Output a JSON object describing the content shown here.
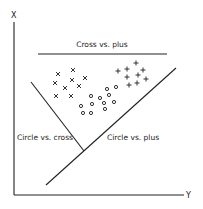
{
  "diagram": {
    "axes": {
      "vertical_label": "X",
      "horizontal_label": "Y"
    },
    "boundaries": [
      {
        "label": "Cross vs. plus",
        "x1": 38,
        "y1": 54,
        "x2": 167,
        "y2": 54
      },
      {
        "label": "Circle vs. cross",
        "x1": 31,
        "y1": 82,
        "x2": 84,
        "y2": 151
      },
      {
        "label": "Circle vs. plus",
        "x1": 46,
        "y1": 185,
        "x2": 176,
        "y2": 68
      }
    ],
    "labels": {
      "cross_vs_plus": "Cross vs. plus",
      "circle_vs_cross": "Circle vs. cross",
      "circle_vs_plus": "Circle vs. plus"
    },
    "classes": {
      "cross": {
        "symbol": "×",
        "points": [
          [
            58,
            74
          ],
          [
            73,
            70
          ],
          [
            85,
            78
          ],
          [
            55,
            83
          ],
          [
            72,
            80
          ],
          [
            65,
            88
          ],
          [
            79,
            86
          ],
          [
            56,
            96
          ],
          [
            71,
            96
          ]
        ]
      },
      "plus": {
        "symbol": "+",
        "points": [
          [
            118,
            71
          ],
          [
            127,
            69
          ],
          [
            136,
            63
          ],
          [
            143,
            70
          ],
          [
            127,
            77
          ],
          [
            138,
            75
          ],
          [
            146,
            79
          ],
          [
            129,
            85
          ],
          [
            137,
            83
          ]
        ]
      },
      "circle": {
        "symbol": "o",
        "points": [
          [
            81,
            106
          ],
          [
            91,
            96
          ],
          [
            107,
            89
          ],
          [
            116,
            87
          ],
          [
            100,
            98
          ],
          [
            109,
            95
          ],
          [
            92,
            104
          ],
          [
            114,
            102
          ],
          [
            104,
            103
          ],
          [
            105,
            109
          ],
          [
            83,
            113
          ],
          [
            91,
            113
          ]
        ]
      }
    }
  }
}
